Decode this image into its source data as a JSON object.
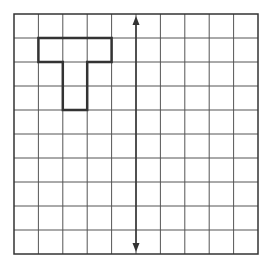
{
  "diagram": {
    "grid": {
      "cols": 10,
      "rows": 10,
      "x0": 14,
      "y0": 14,
      "x1": 258,
      "y1": 254,
      "line_color": "#555555",
      "border_color": "#333333"
    },
    "shape": {
      "name": "T-shape",
      "color": "#333333",
      "cells": [
        [
          1,
          1
        ],
        [
          2,
          1
        ],
        [
          3,
          1
        ],
        [
          2,
          2
        ],
        [
          2,
          3
        ]
      ]
    },
    "symmetry_line": {
      "col": 5,
      "type": "double-arrow",
      "color": "#333333"
    }
  }
}
